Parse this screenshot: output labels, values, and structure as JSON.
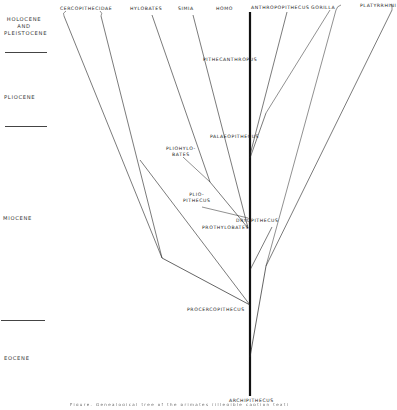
{
  "epochs": [
    {
      "label": "HOLOCENE AND PLEISTOCENE",
      "lines": [
        "HOLOCENE",
        "AND",
        "PLEISTOCENE"
      ]
    },
    {
      "label": "PLIOCENE",
      "lines": [
        "PLIOCENE"
      ]
    },
    {
      "label": "MIOCENE",
      "lines": [
        "MIOCENE"
      ]
    },
    {
      "label": "EOCENE",
      "lines": [
        "EOCENE"
      ]
    }
  ],
  "taxa_top": {
    "cercopithecidae": "CERCOPITHECIDAE",
    "hylobates": "HYLOBATES",
    "simia": "SIMIA",
    "homo": "HOMO",
    "anthropopithecus": "ANTHROPOPITHECUS",
    "gorilla": "GORILLA",
    "platyrrhini": "PLATYRRHINI"
  },
  "nodes": {
    "pithecanthropus": "PITHECANTHROPUS",
    "palaeopithecus": "PALAEOPITHECUS",
    "pliohylobates_1": "PLIOHYLO-",
    "pliohylobates_2": "BATES",
    "pliopithecus_1": "PLIO-",
    "pliopithecus_2": "PITHECUS",
    "dryopithecus": "DRYOPITHECUS",
    "prothylobates": "PROTHYLOBATES",
    "procercopithecus": "PROCERCOPITHECUS",
    "archipithecus": "ARCHIPITHECUS"
  },
  "caption": "Figure. Genealogical tree of the primates (illegible caption text)",
  "colors": {
    "line": "#1a1a1a",
    "background": "#ffffff"
  }
}
